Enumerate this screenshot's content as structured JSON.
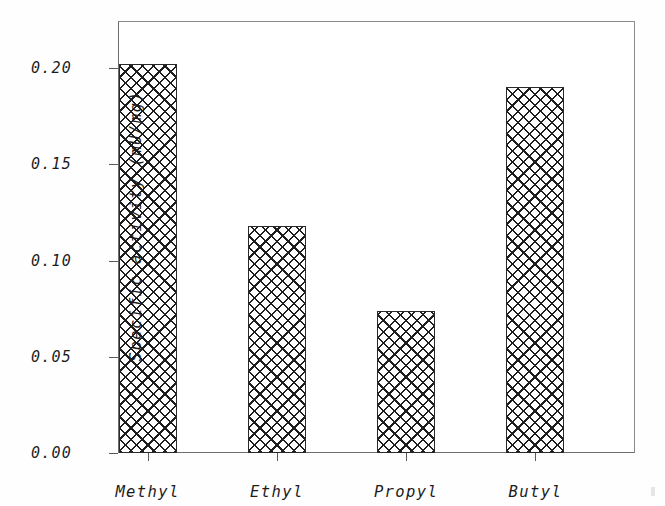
{
  "figure": {
    "background_color": "#ffffff",
    "frame_color": "#6e6e6e",
    "bar_edge_color": "#2a2a2a",
    "bar_hatch": "crosshatch"
  },
  "axes": {
    "y_title": "Specific activity  (mU/mg)",
    "x_title": "",
    "y_ticks": [
      "0.00",
      "0.05",
      "0.10",
      "0.15",
      "0.20"
    ],
    "x_ticks": [
      "Methyl",
      "Ethyl",
      "Propyl",
      "Butyl"
    ]
  },
  "chart_data": {
    "type": "bar",
    "title": "",
    "xlabel": "",
    "ylabel": "Specific activity  (mU/mg)",
    "categories": [
      "Methyl",
      "Ethyl",
      "Propyl",
      "Butyl"
    ],
    "values": [
      0.202,
      0.118,
      0.074,
      0.19
    ],
    "ylim": [
      0.0,
      0.2245
    ],
    "yticks": [
      0.0,
      0.05,
      0.1,
      0.15,
      0.2
    ],
    "ytick_labels": [
      "0.00",
      "0.05",
      "0.10",
      "0.15",
      "0.20"
    ],
    "grid": false,
    "legend": null,
    "bar_fill": "crosshatch-pattern",
    "series": [
      {
        "name": "Specific activity",
        "values": [
          0.202,
          0.118,
          0.074,
          0.19
        ]
      }
    ]
  }
}
